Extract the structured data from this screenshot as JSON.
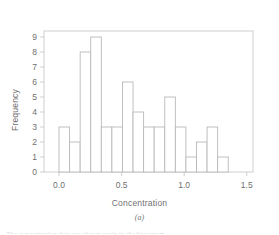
{
  "chart_data": {
    "type": "bar",
    "title": "",
    "subtitle": "",
    "xlabel": "Concentration",
    "ylabel": "Frequency",
    "caption": "(a)",
    "grid": false,
    "legend": null,
    "xlim": [
      -0.12,
      1.55
    ],
    "ylim": [
      0,
      9.4
    ],
    "xticks": [
      "0.0",
      "0.5",
      "1.0",
      "1.5"
    ],
    "xtick_values": [
      0.0,
      0.5,
      1.0,
      1.5
    ],
    "yticks": [
      "0",
      "1",
      "2",
      "3",
      "4",
      "5",
      "6",
      "7",
      "8",
      "9"
    ],
    "ytick_values": [
      0,
      1,
      2,
      3,
      4,
      5,
      6,
      7,
      8,
      9
    ],
    "bin_width": 0.0845,
    "bin_start": 0.0,
    "bin_edges": [
      0.0,
      0.0845,
      0.169,
      0.2535,
      0.338,
      0.4225,
      0.507,
      0.5915,
      0.676,
      0.7605,
      0.845,
      0.9295,
      1.014,
      1.0985,
      1.183,
      1.2675,
      1.352
    ],
    "categories": [
      "0.00",
      "0.08",
      "0.17",
      "0.25",
      "0.34",
      "0.42",
      "0.51",
      "0.59",
      "0.68",
      "0.76",
      "0.85",
      "0.93",
      "1.01",
      "1.10",
      "1.18",
      "1.27"
    ],
    "values": [
      3,
      2,
      8,
      9,
      3,
      3,
      6,
      4,
      3,
      3,
      5,
      3,
      1,
      2,
      3,
      1
    ],
    "bar_fill": "#ffffff",
    "bar_stroke": "#b9b9b9",
    "axis_color": "#c9c9c9",
    "text_color": "#6f6f6f"
  },
  "figure": {
    "bottom_cut_text": "The concentration data are shown again in the histogram"
  }
}
